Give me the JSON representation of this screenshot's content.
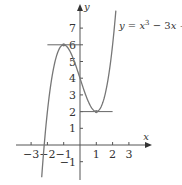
{
  "chart_data": {
    "type": "line",
    "title": "",
    "function": "y = x^3 - 3x + 4",
    "annotation": {
      "text_y": "y",
      "text_eq": " = x",
      "sup": "3",
      "text_rest": " − 3x + 4"
    },
    "xlabel": "x",
    "ylabel": "y",
    "xlim": [
      -3.9,
      4.3
    ],
    "ylim": [
      -2.1,
      8.4
    ],
    "x_ticks": [
      -3,
      -2,
      -1,
      1,
      2,
      3
    ],
    "x_tick_labels": [
      "−3",
      "−2",
      "−1",
      "1",
      "2",
      "3"
    ],
    "y_ticks": [
      -1,
      1,
      2,
      3,
      4,
      5,
      6,
      7
    ],
    "y_tick_labels": [
      "−1",
      "1",
      "2",
      "3",
      "4",
      "5",
      "6",
      "7"
    ],
    "series": [
      {
        "name": "y = x^3 - 3x + 4",
        "x_range": [
          -2.35,
          2.2
        ],
        "color": "#777777"
      }
    ],
    "tangent_lines": [
      {
        "y": 6,
        "x_from": -2,
        "x_to": 0,
        "note": "horizontal tangent at local max (-1, 6)"
      },
      {
        "y": 2,
        "x_from": 0,
        "x_to": 2,
        "note": "horizontal tangent at local min (1, 2)"
      }
    ],
    "critical_points": [
      {
        "x": -1,
        "y": 6,
        "type": "local max"
      },
      {
        "x": 1,
        "y": 2,
        "type": "local min"
      }
    ],
    "grid": false,
    "legend": "none"
  },
  "layout": {
    "origin_px": [
      80,
      145
    ],
    "x_scale": 16.3,
    "y_scale": 16.7
  }
}
